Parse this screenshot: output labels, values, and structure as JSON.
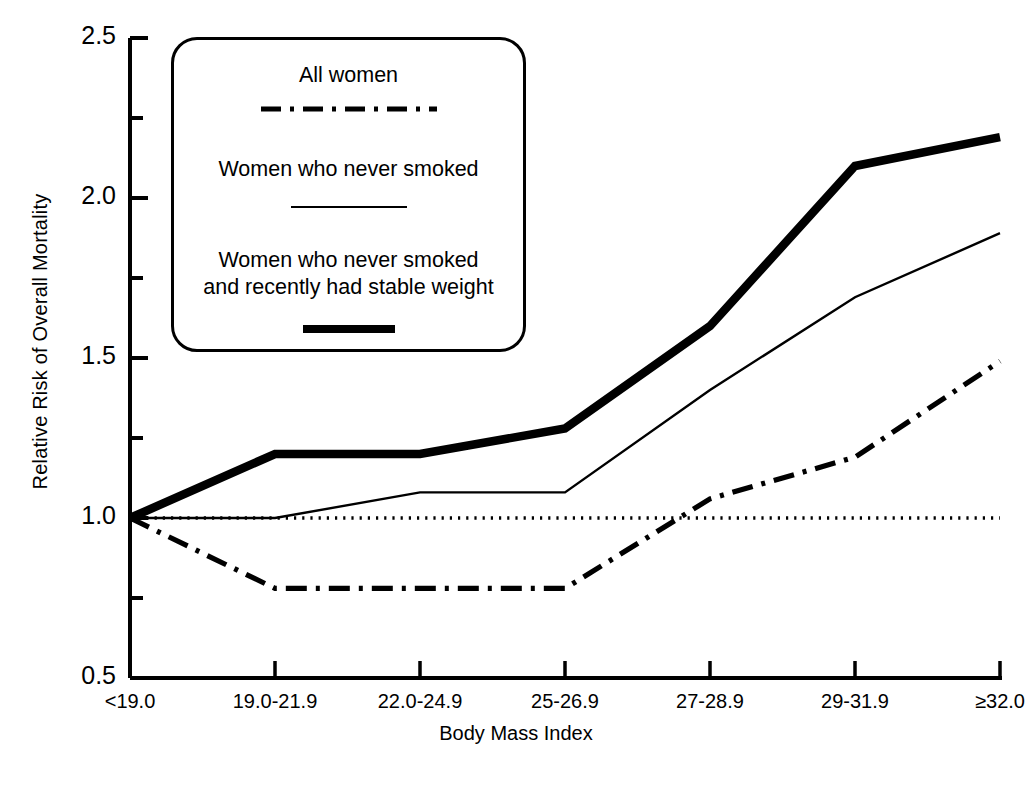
{
  "chart_data": {
    "type": "line",
    "title": "",
    "xlabel": "Body Mass Index",
    "ylabel": "Relative Risk of Overall Mortality",
    "categories": [
      "<19.0",
      "19.0-21.9",
      "22.0-24.9",
      "25-26.9",
      "27-28.9",
      "29-31.9",
      "≥32.0"
    ],
    "ylim": [
      0.5,
      2.5
    ],
    "yticks": [
      "0.5",
      "1.0",
      "1.5",
      "2.0",
      "2.5"
    ],
    "ytick_values": [
      0.5,
      1.0,
      1.5,
      2.0,
      2.5
    ],
    "yminor_values": [
      0.75,
      1.25,
      1.75,
      2.25
    ],
    "grid": false,
    "reference_line": 1.0,
    "legend_position": "upper-left-inset",
    "series": [
      {
        "name": "All women",
        "style": "dash-dot",
        "values": [
          1.0,
          0.78,
          0.78,
          0.78,
          1.06,
          1.19,
          1.49
        ]
      },
      {
        "name": "Women who never smoked",
        "style": "thin-solid",
        "values": [
          1.0,
          1.0,
          1.08,
          1.08,
          1.4,
          1.69,
          1.89
        ]
      },
      {
        "name": "Women who never smoked and recently had stable weight",
        "style": "thick-solid",
        "values": [
          1.0,
          1.2,
          1.2,
          1.28,
          1.6,
          2.1,
          2.19
        ]
      }
    ]
  },
  "legend": {
    "entries": [
      {
        "label_line1": "All women",
        "label_line2": ""
      },
      {
        "label_line1": "Women who never smoked",
        "label_line2": ""
      },
      {
        "label_line1": "Women who never smoked",
        "label_line2": "and recently had stable weight"
      }
    ]
  },
  "colors": {
    "ink": "#000000",
    "background": "#ffffff"
  }
}
